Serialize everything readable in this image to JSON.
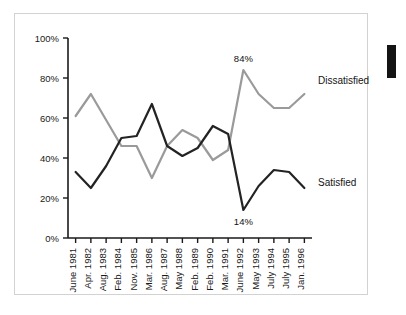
{
  "chart_data": {
    "type": "line",
    "title": "",
    "subtitle": "",
    "xlabel": "",
    "ylabel": "",
    "ylim": [
      0,
      100
    ],
    "yticks": [
      "0%",
      "20%",
      "40%",
      "60%",
      "80%",
      "100%"
    ],
    "ytick_values": [
      0,
      20,
      40,
      60,
      80,
      100
    ],
    "grid": false,
    "legend_position": "right-inline",
    "categories": [
      "June 1981",
      "Apr. 1982",
      "Aug. 1983",
      "Feb. 1984",
      "Nov. 1985",
      "Mar. 1986",
      "Aug. 1987",
      "May 1988",
      "Feb. 1989",
      "Feb. 1990",
      "Mar. 1991",
      "June 1992",
      "May 1993",
      "July 1994",
      "July 1995",
      "Jan. 1996"
    ],
    "series": [
      {
        "name": "Dissatisfied",
        "color": "#9a9a9a",
        "values": [
          61,
          72,
          59,
          46,
          46,
          30,
          46,
          54,
          50,
          39,
          44,
          84,
          72,
          65,
          65,
          72
        ]
      },
      {
        "name": "Satisfied",
        "color": "#232323",
        "values": [
          33,
          25,
          36,
          50,
          51,
          67,
          46,
          41,
          45,
          56,
          52,
          14,
          26,
          34,
          33,
          25
        ]
      }
    ],
    "annotations": [
      {
        "label": "84%",
        "series": "Dissatisfied",
        "category": "June 1992",
        "value": 84
      },
      {
        "label": "14%",
        "series": "Satisfied",
        "category": "June 1992",
        "value": 14
      }
    ]
  },
  "series_labels": {
    "dissatisfied": "Dissatisfied",
    "satisfied": "Satisfied"
  },
  "annotation_labels": {
    "peak": "84%",
    "trough": "14%"
  }
}
